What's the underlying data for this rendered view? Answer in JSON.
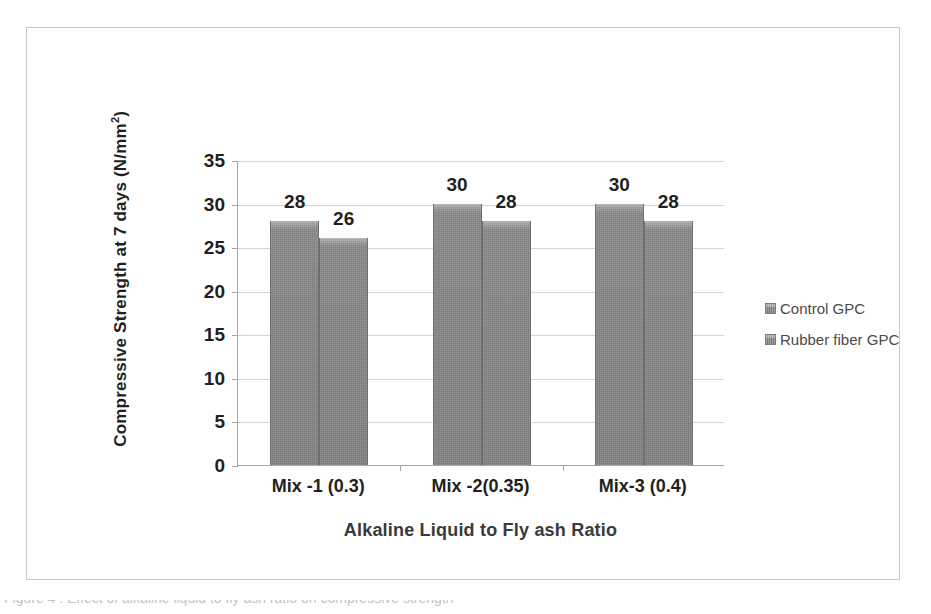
{
  "figure": {
    "y_axis_title": "Compressive Strength at 7 days (N/mm",
    "y_axis_title_sup": "2",
    "y_axis_title_suffix": ")",
    "x_axis_title": "Alkaline Liquid to Fly ash Ratio",
    "caption": "Figure 4 :  Effect of alkaline liquid to fly ash ratio on compressive strength"
  },
  "legend": {
    "position": "right",
    "items": [
      {
        "label": "Control GPC",
        "color": "#8b8b8b"
      },
      {
        "label": "Rubber fiber GPC",
        "color": "#8b8b8b"
      }
    ]
  },
  "colors": {
    "bar_fill": "#8b8b8b",
    "bar_edge": "#6e6e6e",
    "gridline": "#d4d4d4",
    "axis": "#a6a6a6",
    "text": "#231f20",
    "frame": "#c9c9c9"
  },
  "chart_data": {
    "type": "bar",
    "title": "",
    "xlabel": "Alkaline Liquid to Fly ash Ratio",
    "ylabel": "Compressive Strength at 7 days (N/mm²)",
    "categories": [
      "Mix -1 (0.3)",
      "Mix -2(0.35)",
      "Mix-3 (0.4)"
    ],
    "series": [
      {
        "name": "Control GPC",
        "values": [
          28,
          30,
          30
        ]
      },
      {
        "name": "Rubber fiber GPC",
        "values": [
          26,
          28,
          28
        ]
      }
    ],
    "ylim": [
      0,
      35
    ],
    "yticks": [
      0,
      5,
      10,
      15,
      20,
      25,
      30,
      35
    ],
    "ytick_labels": [
      "0",
      "5",
      "10",
      "15",
      "20",
      "25",
      "30",
      "35"
    ],
    "data_labels": [
      [
        "28",
        "26"
      ],
      [
        "30",
        "28"
      ],
      [
        "30",
        "28"
      ]
    ],
    "grid": true,
    "legend_position": "right"
  }
}
